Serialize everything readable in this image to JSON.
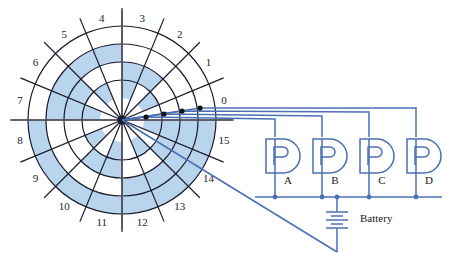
{
  "figure": {
    "background": "#ffffff"
  },
  "colors": {
    "disk_line": "#1a1a28",
    "disk_shade": "#b9d5ee",
    "disk_unshaded": "#ffffff",
    "wire_blue": "#4a6fb5",
    "contact_dot": "#111111",
    "axis_line": "#55555f",
    "label_text": "#1a1a1a"
  },
  "disk": {
    "center": {
      "x": 122,
      "y": 120
    },
    "sector_count": 16,
    "ring_count": 4,
    "ring_radii": [
      22,
      40,
      58,
      76,
      94
    ],
    "label_radius": 104,
    "sector_labels": [
      "0",
      "1",
      "2",
      "3",
      "4",
      "5",
      "6",
      "7",
      "8",
      "9",
      "10",
      "11",
      "12",
      "13",
      "14",
      "15"
    ],
    "spoke_overhang": 16,
    "encoding_note": "ring 1 = innermost (bit A / LSB), ring 4 = outermost (bit D / MSB)",
    "shaded_cells": {
      "ring1_bitA": [
        1,
        3,
        5,
        7,
        9,
        11,
        13,
        15
      ],
      "ring2_bitB": [
        2,
        3,
        6,
        7,
        10,
        11,
        14,
        15
      ],
      "ring3_bitC": [
        4,
        5,
        6,
        7,
        12,
        13,
        14,
        15
      ],
      "ring4_bitD": [
        8,
        9,
        10,
        11,
        12,
        13,
        14,
        15
      ]
    }
  },
  "axes": {
    "horizontal": {
      "x1": 10,
      "y1": 120,
      "x2": 234,
      "y2": 120
    },
    "vertical": {
      "x1": 122,
      "y1": 8,
      "x2": 122,
      "y2": 232
    }
  },
  "brushes": [
    {
      "id": "brush-a",
      "label": "A",
      "ring": 1,
      "dot": {
        "x": 146,
        "y": 117
      },
      "wire_y": 119,
      "lamp": "A"
    },
    {
      "id": "brush-b",
      "label": "B",
      "ring": 2,
      "dot": {
        "x": 164,
        "y": 114
      },
      "wire_y": 116,
      "lamp": "B"
    },
    {
      "id": "brush-c",
      "label": "C",
      "ring": 3,
      "dot": {
        "x": 182,
        "y": 111
      },
      "wire_y": 112,
      "lamp": "C"
    },
    {
      "id": "brush-d",
      "label": "D",
      "ring": 4,
      "dot": {
        "x": 200,
        "y": 108
      },
      "wire_y": 108,
      "lamp": "D"
    }
  ],
  "circuit": {
    "lamps": [
      {
        "name": "A",
        "label": "A",
        "cx": 283,
        "cy": 156,
        "stem_x": 275,
        "label_x": 288,
        "label_y": 184
      },
      {
        "name": "B",
        "label": "B",
        "cx": 330,
        "cy": 156,
        "stem_x": 322,
        "label_x": 335,
        "label_y": 184
      },
      {
        "name": "C",
        "label": "C",
        "cx": 377,
        "cy": 156,
        "stem_x": 369,
        "label_x": 382,
        "label_y": 184
      },
      {
        "name": "D",
        "label": "D",
        "cx": 424,
        "cy": 156,
        "stem_x": 416,
        "label_x": 429,
        "label_y": 184
      }
    ],
    "bus_y": 197,
    "bus_x1": 255,
    "bus_x2": 442,
    "feed_corners": [
      {
        "lamp": "A",
        "x": 275,
        "from_y": 119,
        "down_to": 137
      },
      {
        "lamp": "B",
        "x": 322,
        "from_y": 116,
        "down_to": 137
      },
      {
        "lamp": "C",
        "x": 369,
        "from_y": 112,
        "down_to": 137
      },
      {
        "lamp": "D",
        "x": 416,
        "from_y": 108,
        "down_to": 137
      }
    ],
    "battery": {
      "label": "Battery",
      "label_x": 360,
      "label_y": 222,
      "x": 337,
      "top_y": 197,
      "bottom_y": 252,
      "plate_center_y": 220,
      "plates": [
        {
          "half_width": 11,
          "dy": -8
        },
        {
          "half_width": 6,
          "dy": -4
        },
        {
          "half_width": 11,
          "dy": 0
        },
        {
          "half_width": 6,
          "dy": 4
        },
        {
          "half_width": 11,
          "dy": 8
        }
      ]
    },
    "return_line": {
      "from": {
        "x": 122,
        "y": 120
      },
      "to": {
        "x": 337,
        "y": 252
      }
    },
    "junction_dots": [
      {
        "x": 275,
        "y": 197
      },
      {
        "x": 322,
        "y": 197
      },
      {
        "x": 337,
        "y": 197
      },
      {
        "x": 369,
        "y": 197
      },
      {
        "x": 416,
        "y": 197
      }
    ]
  }
}
